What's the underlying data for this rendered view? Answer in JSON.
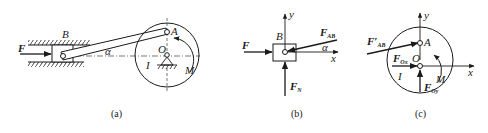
{
  "figures": {
    "a": {
      "caption": "(a)",
      "labels": {
        "force": "F",
        "slider": "B",
        "angle": "α",
        "crank_end": "A",
        "pivot": "O",
        "body": "I",
        "moment": "M"
      }
    },
    "b": {
      "caption": "(b)",
      "labels": {
        "force": "F",
        "slider": "B",
        "force_ab": "F",
        "force_ab_sub": "AB",
        "angle": "α",
        "normal": "F",
        "normal_sub": "N",
        "x_axis": "x",
        "y_axis": "y"
      }
    },
    "c": {
      "caption": "(c)",
      "labels": {
        "force_ab": "F′",
        "force_ab_sub": "AB",
        "point_a": "A",
        "pivot": "O",
        "fox": "F",
        "fox_sub": "Ox",
        "foy": "F",
        "foy_sub": "Oy",
        "body": "I",
        "moment": "M",
        "x_axis": "x",
        "y_axis": "y"
      }
    }
  },
  "colors": {
    "ink": "#1a1a1a",
    "background": "#ffffff"
  }
}
